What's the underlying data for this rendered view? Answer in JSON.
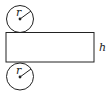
{
  "diagram": {
    "top_circle": {
      "label": "r"
    },
    "bottom_circle": {
      "label": "r"
    },
    "rectangle": {
      "side_label": "h"
    },
    "colors": {
      "stroke": "#222222",
      "background": "#ffffff"
    }
  }
}
